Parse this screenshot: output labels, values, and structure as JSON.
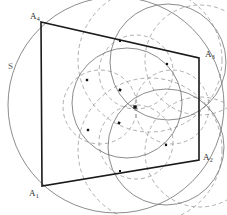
{
  "figure": {
    "background_color": "#ffffff",
    "width": 227,
    "height": 215,
    "solid_stroke_color": "#1a1a1a",
    "thin_stroke_color": "#6e6e6e",
    "dashed_stroke_color": "#9a9a9a",
    "point_color": "#111111",
    "labels": [
      {
        "id": "A4",
        "text": "A",
        "sub": "4",
        "x": 30,
        "y": 12,
        "anchor": "top-left-vertex"
      },
      {
        "id": "A3",
        "text": "A",
        "sub": "3",
        "x": 205,
        "y": 50,
        "anchor": "top-right-vertex"
      },
      {
        "id": "A2",
        "text": "A",
        "sub": "2",
        "x": 203,
        "y": 153,
        "anchor": "bottom-right-vertex"
      },
      {
        "id": "A1",
        "text": "A",
        "sub": "1",
        "x": 29,
        "y": 189,
        "anchor": "bottom-left-vertex"
      },
      {
        "id": "S",
        "text": "S",
        "sub": "",
        "x": 8,
        "y": 62,
        "anchor": "outer-circle"
      }
    ],
    "quadrilateral": {
      "name": "A1 A2 A3 A4",
      "vertices": [
        {
          "id": "A4",
          "x": 41,
          "y": 22
        },
        {
          "id": "A3",
          "x": 199,
          "y": 58
        },
        {
          "id": "A2",
          "x": 199,
          "y": 160
        },
        {
          "id": "A1",
          "x": 42,
          "y": 186
        }
      ]
    },
    "outer_circle": {
      "id": "S",
      "cx": 116,
      "cy": 105,
      "r": 108,
      "style": "thin-solid"
    },
    "thin_circles": [
      {
        "id": "inner-medium",
        "cx": 127,
        "cy": 103,
        "r": 55,
        "style": "thin-solid"
      },
      {
        "id": "upper-right-arc",
        "cx": 168,
        "cy": 62,
        "r": 58,
        "style": "thin-solid"
      },
      {
        "id": "lower-right-arc",
        "cx": 166,
        "cy": 147,
        "r": 58,
        "style": "thin-solid"
      }
    ],
    "dashed_circles": [
      {
        "id": "dashed-large-top",
        "cx": 150,
        "cy": 60,
        "r": 72
      },
      {
        "id": "dashed-large-bottom",
        "cx": 150,
        "cy": 150,
        "r": 72
      },
      {
        "id": "dashed-petal-left",
        "cx": 100,
        "cy": 107,
        "r": 37
      },
      {
        "id": "dashed-petal-right",
        "cx": 172,
        "cy": 107,
        "r": 37
      },
      {
        "id": "dashed-petal-top",
        "cx": 136,
        "cy": 72,
        "r": 37
      },
      {
        "id": "dashed-petal-bottom",
        "cx": 136,
        "cy": 142,
        "r": 37
      },
      {
        "id": "dashed-far-right-upper",
        "cx": 200,
        "cy": 60,
        "r": 55
      },
      {
        "id": "dashed-far-right-lower",
        "cx": 200,
        "cy": 152,
        "r": 55
      }
    ],
    "marked_points": [
      {
        "id": "center",
        "x": 135,
        "y": 107,
        "size": 3.4
      },
      {
        "id": "p-upper-left",
        "x": 87,
        "y": 80,
        "size": 2.4
      },
      {
        "id": "p-lower-left",
        "x": 88,
        "y": 130,
        "size": 2.4
      },
      {
        "id": "p-upper-right",
        "x": 167,
        "y": 64,
        "size": 2.2
      },
      {
        "id": "p-lower-right",
        "x": 166,
        "y": 145,
        "size": 2.2
      },
      {
        "id": "p-top-edge",
        "x": 120,
        "y": 41,
        "size": 2.0
      },
      {
        "id": "p-bottom-edge",
        "x": 120,
        "y": 171,
        "size": 2.0
      },
      {
        "id": "p-inner-upper",
        "x": 120,
        "y": 90,
        "size": 2.6
      },
      {
        "id": "p-inner-lower",
        "x": 119,
        "y": 123,
        "size": 2.6
      }
    ]
  }
}
